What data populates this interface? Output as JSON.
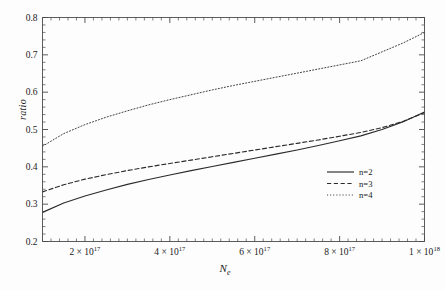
{
  "figure": {
    "background": "#fdfdfd",
    "axis_color": "#4a4a4a",
    "curve_color": "#2b2b2b"
  },
  "axes": {
    "ylabel": "ratio",
    "xlabel_base": "N",
    "xlabel_sub": "e",
    "y_ticks": [
      "0.2",
      "0.3",
      "0.4",
      "0.5",
      "0.6",
      "0.7",
      "0.8"
    ],
    "x_tick_mantissas": [
      "2",
      "4",
      "6",
      "8",
      "1"
    ],
    "x_tick_exponents": [
      "17",
      "17",
      "17",
      "17",
      "18"
    ],
    "x_tick_times": "×",
    "x_tick_base": "10"
  },
  "legend": {
    "entries": [
      {
        "label": "n=2",
        "style": "solid"
      },
      {
        "label": "n=3",
        "style": "dashed"
      },
      {
        "label": "n=4",
        "style": "dotted"
      }
    ]
  },
  "chart_data": {
    "type": "line",
    "title": "",
    "xlabel": "N_e",
    "ylabel": "ratio",
    "xlim": [
      1e+17,
      1e+18
    ],
    "ylim": [
      0.2,
      0.8
    ],
    "grid": false,
    "legend_position": "center-right",
    "x_tick_values": [
      2e+17,
      4e+17,
      6e+17,
      8e+17,
      1e+18
    ],
    "x_tick_labels": [
      "2 × 10^17",
      "4 × 10^17",
      "6 × 10^17",
      "8 × 10^17",
      "1 × 10^18"
    ],
    "y_tick_values": [
      0.2,
      0.3,
      0.4,
      0.5,
      0.6,
      0.7,
      0.8
    ],
    "y_tick_labels": [
      "0.2",
      "0.3",
      "0.4",
      "0.5",
      "0.6",
      "0.7",
      "0.8"
    ],
    "y_minor_step": 0.02,
    "x": [
      1e+17,
      1.5e+17,
      2e+17,
      2.5e+17,
      3e+17,
      3.5e+17,
      4e+17,
      4.5e+17,
      5e+17,
      5.5e+17,
      6e+17,
      6.5e+17,
      7e+17,
      7.5e+17,
      8e+17,
      8.5e+17,
      9e+17,
      9.5e+17,
      1e+18
    ],
    "series": [
      {
        "name": "n=2",
        "style": "solid",
        "values": [
          0.278,
          0.303,
          0.322,
          0.338,
          0.353,
          0.366,
          0.378,
          0.39,
          0.401,
          0.412,
          0.423,
          0.434,
          0.445,
          0.457,
          0.47,
          0.483,
          0.5,
          0.521,
          0.547
        ]
      },
      {
        "name": "n=3",
        "style": "dashed",
        "values": [
          0.333,
          0.352,
          0.367,
          0.379,
          0.39,
          0.4,
          0.409,
          0.418,
          0.427,
          0.436,
          0.445,
          0.454,
          0.463,
          0.472,
          0.482,
          0.492,
          0.505,
          0.522,
          0.545
        ]
      },
      {
        "name": "n=4",
        "style": "dotted",
        "values": [
          0.455,
          0.489,
          0.513,
          0.533,
          0.55,
          0.566,
          0.58,
          0.593,
          0.606,
          0.618,
          0.629,
          0.64,
          0.651,
          0.662,
          0.673,
          0.684,
          0.708,
          0.732,
          0.76
        ]
      }
    ],
    "annotations": [
      "n=2 and n=3 curves intersect near N_e = 8.7e17, ratio = 0.495"
    ]
  }
}
